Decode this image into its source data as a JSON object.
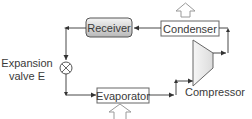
{
  "diagram": {
    "type": "refrigeration-cycle",
    "components": {
      "receiver": {
        "label": "Receiver"
      },
      "condenser": {
        "label": "Condenser"
      },
      "evaporator": {
        "label": "Evaporator"
      },
      "compressor": {
        "label": "Compressor"
      },
      "expansion_valve": {
        "label_line1": "Expansion",
        "label_line2": "valve E"
      }
    },
    "heat_flow": {
      "condenser": "up-arrow-out",
      "evaporator": "up-arrow-in"
    },
    "flow_order": [
      "Compressor",
      "Condenser",
      "Receiver",
      "Expansion valve E",
      "Evaporator",
      "Compressor"
    ],
    "colors": {
      "line": "#333333",
      "box_border": "#555555",
      "receiver_fill_top": "#f2f2f2",
      "receiver_fill_bottom": "#bdbdbd",
      "compressor_fill": "#ececec",
      "text": "#3a3a3a",
      "heat_arrow": "#9a9a9a"
    }
  }
}
